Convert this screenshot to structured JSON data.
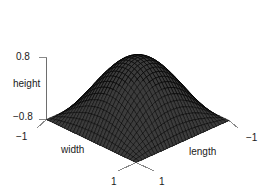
{
  "figure": {
    "kind": "perspective-surface-plot",
    "background_color": "#ffffff",
    "axis_color": "#6e6e6e",
    "mesh_line_color": "#000000",
    "mesh_face_color": "#3c3c3c",
    "text_color": "#1a1a1a"
  },
  "chart_data": {
    "type": "surface",
    "title": "",
    "xlabel": "width",
    "ylabel": "length",
    "zlabel": "height",
    "xlim": [
      -1,
      1
    ],
    "ylim": [
      -1,
      1
    ],
    "zlim": [
      -0.8,
      0.8
    ],
    "xticks": [
      -1,
      1
    ],
    "yticks": [
      -1,
      1
    ],
    "zticks": [
      -0.8,
      0.8
    ],
    "xticklabels": [
      "-1",
      "1"
    ],
    "yticklabels": [
      "-1",
      "1"
    ],
    "zticklabels": [
      "-0.8",
      "0.8"
    ],
    "grid": false,
    "legend": null,
    "surface_function": "z = cos(pi*x/2) * cos(pi*y/2) * 1.6 - 0.8",
    "surface_description": "Single smooth peak centered at (0,0), rising to z = 0.8 at the centre and falling to z = -0.8 along all four edges of the square domain",
    "mesh_nx": 30,
    "mesh_ny": 30,
    "view": {
      "theta": 45,
      "phi": 22,
      "projection": "perspective"
    },
    "z_values_sample": {
      "center_0_0": 0.8,
      "corner_m1_m1": -0.8,
      "corner_m1_1": -0.8,
      "corner_1_m1": -0.8,
      "corner_1_1": -0.8,
      "edge_mid_0_m1": -0.8,
      "half_0p5_0": 0.331,
      "half_0_0p5": 0.331,
      "half_0p5_0p5": -0.235
    }
  },
  "labels": {
    "z_tick_top": "0.8",
    "z_tick_bottom": "−0.8",
    "z_axis_title": "height",
    "x_tick_min": "−1",
    "x_tick_max": "1",
    "x_axis_title": "width",
    "y_tick_min": "−1",
    "y_tick_max": "1",
    "y_axis_title": "length"
  }
}
